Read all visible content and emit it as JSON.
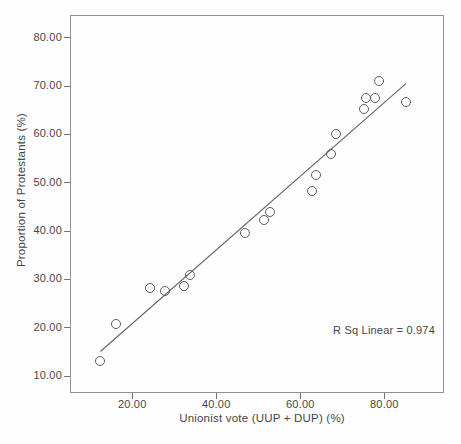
{
  "colors": {
    "background": "#fefefe",
    "frame": "#909090",
    "tick": "#6f6f6f",
    "text": "#474747",
    "marker_outline": "#5c5c5c",
    "fit_line": "#636363"
  },
  "chart_data": {
    "type": "scatter",
    "title": "",
    "xlabel": "Unionist vote (UUP + DUP) (%)",
    "ylabel": "Proportion of Protestants (%)",
    "annotation": "R Sq Linear = 0.974",
    "r_squared": 0.974,
    "grid": false,
    "legend": null,
    "xlim": [
      5.2,
      94.2
    ],
    "ylim": [
      6.4,
      84.6
    ],
    "x_ticks": [
      20,
      40,
      60,
      80
    ],
    "x_tick_labels": [
      "20.00",
      "40.00",
      "60.00",
      "80.00"
    ],
    "y_ticks": [
      10,
      20,
      30,
      40,
      50,
      60,
      70,
      80
    ],
    "y_tick_labels": [
      "10.00",
      "20.00",
      "30.00",
      "40.00",
      "50.00",
      "60.00",
      "70.00",
      "80.00"
    ],
    "points": [
      [
        12.2,
        13.2
      ],
      [
        16.0,
        20.8
      ],
      [
        24.0,
        28.3
      ],
      [
        27.5,
        27.8
      ],
      [
        32.0,
        28.7
      ],
      [
        33.6,
        31.0
      ],
      [
        46.5,
        39.7
      ],
      [
        51.0,
        42.5
      ],
      [
        52.5,
        44.1
      ],
      [
        62.5,
        48.5
      ],
      [
        63.4,
        51.8
      ],
      [
        67.0,
        56.0
      ],
      [
        68.2,
        60.3
      ],
      [
        74.8,
        65.3
      ],
      [
        75.4,
        67.6
      ],
      [
        77.6,
        67.7
      ],
      [
        78.5,
        71.1
      ],
      [
        84.8,
        66.8
      ]
    ],
    "fit_line": {
      "x1": 12.2,
      "y1": 15.2,
      "x2": 84.9,
      "y2": 70.6
    }
  }
}
